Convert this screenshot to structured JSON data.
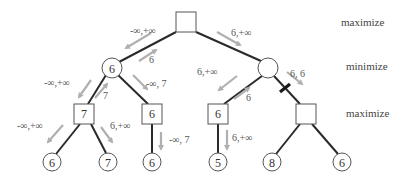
{
  "levels": [
    {
      "label": "maximize"
    },
    {
      "label": "minimize"
    },
    {
      "label": "maximize"
    }
  ],
  "nodes": {
    "root": {
      "type": "max",
      "value": ""
    },
    "min_left": {
      "type": "min",
      "value": "6"
    },
    "min_right": {
      "type": "min",
      "value": ""
    },
    "max_ll": {
      "type": "max",
      "value": "7"
    },
    "max_lr": {
      "type": "max",
      "value": "6"
    },
    "max_rl": {
      "type": "max",
      "value": "6"
    },
    "max_rr": {
      "type": "max",
      "value": ""
    },
    "leaf1": {
      "type": "leaf",
      "value": "6"
    },
    "leaf2": {
      "type": "leaf",
      "value": "7"
    },
    "leaf3": {
      "type": "leaf",
      "value": "6"
    },
    "leaf4": {
      "type": "leaf",
      "value": "5"
    },
    "leaf5": {
      "type": "leaf",
      "value": "8"
    },
    "leaf6": {
      "type": "leaf",
      "value": "6"
    }
  },
  "annotations": {
    "root_to_minleft_down": "-∞,+∞",
    "minleft_to_root_up": "6",
    "root_to_minright_down": "6,+∞",
    "minleft_to_maxll_down": "-∞,+∞",
    "maxll_to_minleft_up": "7",
    "minleft_to_maxlr_down": "-∞, 7",
    "maxll_to_leaf1_down": "-∞,+∞",
    "maxll_to_leaf2_down": "6,+∞",
    "maxlr_to_leaf3_down": "-∞, 7",
    "minright_to_maxrl_down": "6,+∞",
    "maxrl_to_minright_up": "6",
    "minright_to_maxrr_down": "6, 6",
    "maxrl_to_leaf4_down": "6,+∞"
  },
  "pruned_edge": "min_right → max_rr"
}
